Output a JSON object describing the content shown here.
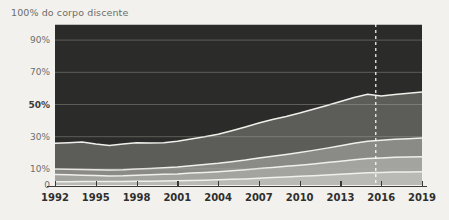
{
  "chart_data": {
    "type": "area",
    "title": "100% do corpo discente",
    "xlabel": "",
    "ylabel": "",
    "stacked": true,
    "grid": true,
    "legend": "none",
    "xlim": [
      1992,
      2019
    ],
    "ylim": [
      0,
      100
    ],
    "ytick_labels": [
      "90%",
      "70%",
      "50%",
      "30%",
      "10%",
      "0"
    ],
    "ytick_values": [
      90,
      70,
      50,
      30,
      10,
      0
    ],
    "ytick_bold": [
      "50%"
    ],
    "xtick_labels": [
      "1992",
      "1995",
      "1998",
      "2001",
      "2004",
      "2007",
      "2010",
      "2013",
      "2016",
      "2019"
    ],
    "xtick_values": [
      1992,
      1995,
      1998,
      2001,
      2004,
      2007,
      2010,
      2013,
      2016,
      2019
    ],
    "annotations": [
      {
        "type": "vertical-dashed-line",
        "x": 2015.6,
        "color": "#ffffff"
      }
    ],
    "x": [
      1992,
      1993,
      1994,
      1995,
      1996,
      1997,
      1998,
      1999,
      2000,
      2001,
      2002,
      2003,
      2004,
      2005,
      2006,
      2007,
      2008,
      2009,
      2010,
      2011,
      2012,
      2013,
      2014,
      2015,
      2016,
      2017,
      2018,
      2019
    ],
    "series": [
      {
        "name": "layer-1-bottom",
        "color": "#b9b9b5",
        "values": [
          2.0,
          2.0,
          2.1,
          2.1,
          2.2,
          2.2,
          2.3,
          2.4,
          2.5,
          2.6,
          2.8,
          3.0,
          3.2,
          3.5,
          3.8,
          4.2,
          4.6,
          5.0,
          5.4,
          5.8,
          6.2,
          6.7,
          7.2,
          7.6,
          7.8,
          8.0,
          8.1,
          8.2
        ]
      },
      {
        "name": "layer-2",
        "color": "#a3a39f",
        "values": [
          4.5,
          4.3,
          4.0,
          3.8,
          3.4,
          3.5,
          3.7,
          3.9,
          4.1,
          4.3,
          4.6,
          4.8,
          5.1,
          5.4,
          5.7,
          6.0,
          6.3,
          6.6,
          6.9,
          7.3,
          7.7,
          8.1,
          8.5,
          8.8,
          9.0,
          9.2,
          9.3,
          9.4
        ]
      },
      {
        "name": "layer-3",
        "color": "#8a8a86",
        "values": [
          3.5,
          3.5,
          3.6,
          3.6,
          3.7,
          3.8,
          3.9,
          4.0,
          4.1,
          4.3,
          4.6,
          4.9,
          5.2,
          5.6,
          6.0,
          6.5,
          7.0,
          7.4,
          7.9,
          8.4,
          9.0,
          9.6,
          10.2,
          10.8,
          11.0,
          11.2,
          11.4,
          11.6
        ]
      },
      {
        "name": "layer-4",
        "color": "#5c5c59",
        "values": [
          16.0,
          16.5,
          17.0,
          16.0,
          15.2,
          16.0,
          16.3,
          15.8,
          15.6,
          16.0,
          16.6,
          17.2,
          18.0,
          19.2,
          20.5,
          21.8,
          22.8,
          23.6,
          24.5,
          25.5,
          26.5,
          27.5,
          28.5,
          29.2,
          27.5,
          27.8,
          28.2,
          28.5
        ]
      },
      {
        "name": "layer-5-top",
        "color": "#2b2b29",
        "values": [
          74.0,
          73.7,
          73.3,
          74.5,
          75.5,
          74.5,
          73.8,
          73.9,
          73.7,
          72.8,
          71.4,
          70.1,
          68.5,
          66.3,
          64.0,
          61.5,
          59.3,
          57.4,
          55.3,
          53.0,
          50.6,
          48.1,
          45.6,
          43.6,
          44.7,
          43.8,
          43.0,
          42.3
        ]
      }
    ]
  }
}
